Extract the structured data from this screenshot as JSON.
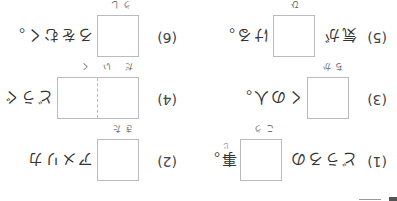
{
  "worksheet": {
    "orientation": "rotated-180",
    "questions": [
      {
        "number": "(1)",
        "before": "どうろの",
        "box_reading": "こう",
        "after": "事。",
        "after_reading": "じ"
      },
      {
        "number": "(2)",
        "before": "",
        "box_reading": "きた",
        "after": "アメリカ",
        "after_reading": ""
      },
      {
        "number": "(3)",
        "before": "",
        "box_reading": "ちか",
        "after": "くの人。",
        "after_reading": ""
      },
      {
        "number": "(4)",
        "before": "",
        "box_reading": "だいく",
        "after": "どうぐ",
        "after_reading": ""
      },
      {
        "number": "(5)",
        "before": "気が",
        "box_reading": "ひ",
        "after": "ける。",
        "after_reading": ""
      },
      {
        "number": "(6)",
        "before": "",
        "box_reading": "うし",
        "after": "ろをむく。",
        "after_reading": ""
      }
    ]
  }
}
